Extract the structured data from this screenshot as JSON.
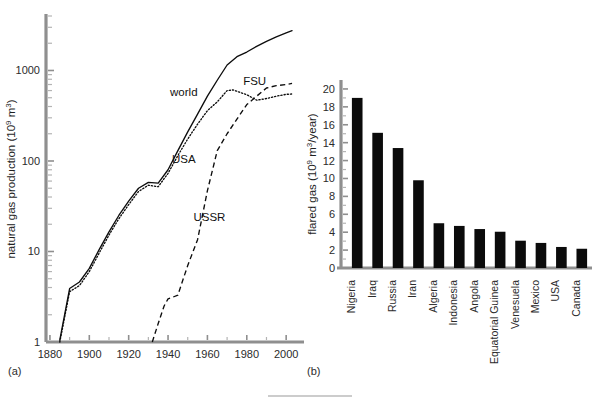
{
  "figure": {
    "panel_a_label": "(a)",
    "panel_b_label": "(b)"
  },
  "chart_data": [
    {
      "id": "panel-a",
      "type": "line",
      "title": "",
      "xlabel": "",
      "ylabel": "natural gas production (10⁹ m³)",
      "yscale": "log",
      "ylim": [
        1,
        4000
      ],
      "xlim": [
        1878,
        2005
      ],
      "grid": false,
      "legend_position": "inline-annotations",
      "ytick_labels": [
        "1",
        "10",
        "100",
        "1000"
      ],
      "ytick_values": [
        1,
        10,
        100,
        1000
      ],
      "xtick_labels": [
        "1880",
        "1900",
        "1920",
        "1940",
        "1960",
        "1980",
        "2000"
      ],
      "xtick_values": [
        1880,
        1900,
        1920,
        1940,
        1960,
        1980,
        2000
      ],
      "annotations": [
        {
          "text": "world",
          "x": 1948,
          "y": 520
        },
        {
          "text": "USA",
          "x": 1948,
          "y": 95
        },
        {
          "text": "FSU",
          "x": 1984,
          "y": 700
        },
        {
          "text": "USSR",
          "x": 1961,
          "y": 22
        }
      ],
      "series": [
        {
          "name": "world",
          "style": "solid",
          "x": [
            1885,
            1890,
            1895,
            1900,
            1905,
            1910,
            1915,
            1920,
            1925,
            1930,
            1935,
            1940,
            1945,
            1950,
            1955,
            1960,
            1965,
            1970,
            1975,
            1980,
            1985,
            1990,
            1995,
            2000,
            2003
          ],
          "y": [
            1.05,
            3.9,
            4.6,
            6.5,
            10.5,
            16.5,
            25,
            36,
            50,
            58,
            57,
            80,
            130,
            210,
            330,
            520,
            780,
            1150,
            1420,
            1600,
            1850,
            2100,
            2350,
            2600,
            2750
          ]
        },
        {
          "name": "USA",
          "style": "dotted",
          "x": [
            1885,
            1890,
            1895,
            1900,
            1905,
            1910,
            1915,
            1920,
            1925,
            1930,
            1935,
            1940,
            1945,
            1950,
            1955,
            1960,
            1965,
            1970,
            1973,
            1980,
            1985,
            1990,
            1995,
            2000,
            2003
          ],
          "y": [
            1.0,
            3.6,
            4.2,
            6.0,
            9.6,
            15.2,
            23,
            33,
            46,
            54,
            52,
            73,
            115,
            175,
            255,
            360,
            450,
            600,
            610,
            540,
            470,
            490,
            520,
            545,
            550
          ]
        },
        {
          "name": "USSR",
          "style": "dashed",
          "x": [
            1932,
            1935,
            1938,
            1940,
            1942,
            1945,
            1948,
            1950,
            1955,
            1960,
            1965,
            1970,
            1975,
            1980,
            1985,
            1990,
            1995,
            2000,
            2003
          ],
          "y": [
            1.0,
            1.6,
            2.5,
            3.0,
            3.1,
            3.3,
            5.2,
            7.0,
            13.5,
            47,
            130,
            200,
            290,
            420,
            520,
            640,
            680,
            700,
            720
          ]
        }
      ]
    },
    {
      "id": "panel-b",
      "type": "bar",
      "title": "",
      "xlabel": "",
      "ylabel": "flared gas (10⁹ m³/year)",
      "yscale": "linear",
      "ylim": [
        0,
        21
      ],
      "grid": false,
      "ytick_labels": [
        "0",
        "2",
        "4",
        "6",
        "8",
        "10",
        "12",
        "14",
        "16",
        "18",
        "20"
      ],
      "ytick_values": [
        0,
        2,
        4,
        6,
        8,
        10,
        12,
        14,
        16,
        18,
        20
      ],
      "categories": [
        "Nigeria",
        "Iraq",
        "Russia",
        "Iran",
        "Algeria",
        "Indonesia",
        "Angola",
        "Equatorial Guinea",
        "Venesuela",
        "Mexico",
        "USA",
        "Canada"
      ],
      "values": [
        19.0,
        15.1,
        13.4,
        9.8,
        5.0,
        4.7,
        4.35,
        4.05,
        3.05,
        2.8,
        2.35,
        2.15
      ]
    }
  ]
}
